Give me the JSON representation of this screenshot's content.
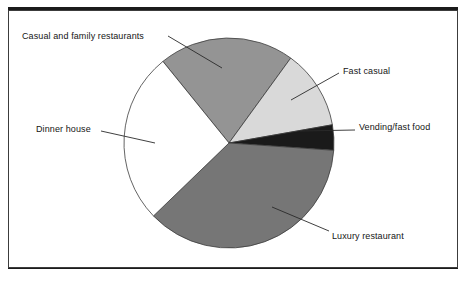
{
  "chart_data": {
    "type": "pie",
    "title": "",
    "subtitle": "",
    "xlabel": "",
    "ylabel": "",
    "legend_position": "callout-labels",
    "grid": false,
    "center": {
      "x": 229,
      "y": 143
    },
    "radius": 105,
    "start_angle_deg": 321,
    "categories": [
      "Casual and family restaurants",
      "Fast casual",
      "Vending/fast food",
      "Luxury restaurant",
      "Dinner house"
    ],
    "values": [
      20.8,
      12.2,
      3.8,
      36.7,
      26.5
    ],
    "series": [
      {
        "name": "Share",
        "values": [
          20.8,
          12.2,
          3.8,
          36.7,
          26.5
        ]
      }
    ],
    "slices": [
      {
        "label": "Casual and family restaurants",
        "value": 20.8,
        "color": "#949494",
        "start_angle_deg": 321,
        "end_angle_deg": 396
      },
      {
        "label": "Fast casual",
        "value": 12.2,
        "color": "#d9d9d9",
        "start_angle_deg": 396,
        "end_angle_deg": 440
      },
      {
        "label": "Vending/fast food",
        "value": 3.8,
        "color": "#1a1a1a",
        "start_angle_deg": 440,
        "end_angle_deg": 454
      },
      {
        "label": "Luxury restaurant",
        "value": 36.7,
        "color": "#767676",
        "start_angle_deg": 454,
        "end_angle_deg": 586
      },
      {
        "label": "Dinner house",
        "value": 26.5,
        "color": "#ffffff",
        "start_angle_deg": 586,
        "end_angle_deg": 681
      }
    ],
    "colors": {
      "casual_and_family_restaurants": "#949494",
      "fast_casual": "#d9d9d9",
      "vending_fast_food": "#1a1a1a",
      "luxury_restaurant": "#767676",
      "dinner_house": "#ffffff",
      "outline": "#3c3c3c",
      "leader_line": "#2a2a2a",
      "text": "#151515",
      "rule": "#1b1b1b"
    }
  },
  "labels": {
    "casual": "Casual and family restaurants",
    "fast_casual": "Fast casual",
    "vending": "Vending/fast food",
    "luxury": "Luxury restaurant",
    "dinner": "Dinner house"
  }
}
